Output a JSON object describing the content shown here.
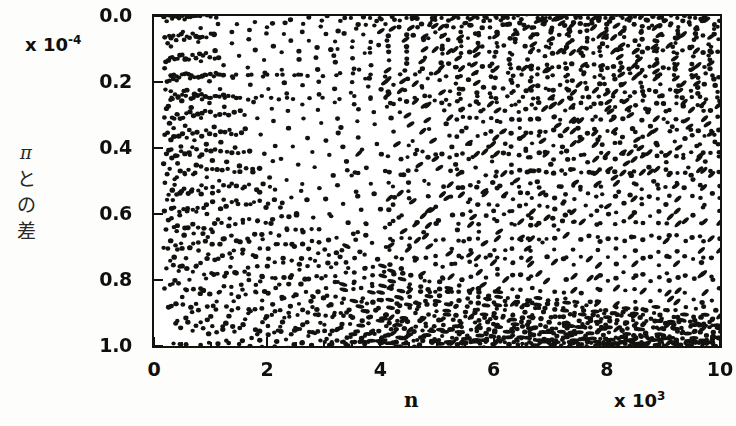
{
  "figure": {
    "background": "#fdfdfb",
    "ink_color": "#14120f"
  },
  "axes": {
    "y_multiplier": "x 10",
    "y_multiplier_exponent": "-4",
    "x_multiplier": "x 10",
    "x_multiplier_exponent": "3",
    "x_axis_title": "n",
    "y_axis_title_chars": [
      "π",
      "と",
      "の",
      "差"
    ],
    "y_tick_labels": [
      "1.0",
      "0.8",
      "0.6",
      "0.4",
      "0.2",
      "0.0"
    ],
    "x_tick_labels": [
      "0",
      "2",
      "4",
      "6",
      "8",
      "10"
    ]
  },
  "chart_data": {
    "type": "scatter",
    "title": "",
    "subtitle": "",
    "xlabel": "n",
    "ylabel": "πとの差",
    "x_unit_multiplier": 1000,
    "y_unit_multiplier": 0.0001,
    "xlim": [
      0,
      10
    ],
    "ylim": [
      0.0,
      1.0
    ],
    "xticks": [
      0,
      2,
      4,
      6,
      8,
      10
    ],
    "yticks": [
      0.0,
      0.2,
      0.4,
      0.6,
      0.8,
      1.0
    ],
    "x_minor_tick_step": 0.5,
    "grid": false,
    "legend": null,
    "marker": {
      "shape": "circle",
      "color": "#14120f",
      "size_px": 4.6
    },
    "generator": {
      "family": "fractional-part-hyperbolae",
      "note": "Points lie at y = frac(n*alpha)/n style loci; each arc k is y_k(x) = c_k / x with c_k spanning the listed constants, plus horizontal loci listed in horizontal_bands.",
      "alpha": 3.14159265358979,
      "n_min": 120,
      "n_max": 10000,
      "n_step": 1
    },
    "horizontal_bands": [
      {
        "y": 0.822,
        "x_from": 0.3,
        "x_to": 10.0,
        "spacing": 0.27
      },
      {
        "y": 0.752,
        "x_from": 0.3,
        "x_to": 10.0,
        "spacing": 0.27
      }
    ],
    "arc_constants": [
      0.3,
      0.52,
      0.74,
      0.98,
      1.24,
      1.52,
      1.82,
      2.14,
      2.48,
      2.84,
      3.22,
      3.62,
      4.04,
      4.48,
      4.94,
      5.42,
      5.92,
      6.44,
      6.98,
      7.54,
      8.12,
      8.72,
      9.34,
      9.98
    ],
    "sample_points": [
      {
        "x": 0.35,
        "y": 0.822
      },
      {
        "x": 0.62,
        "y": 0.822
      },
      {
        "x": 0.9,
        "y": 0.822
      },
      {
        "x": 1.17,
        "y": 0.822
      },
      {
        "x": 1.45,
        "y": 0.822
      },
      {
        "x": 1.72,
        "y": 0.822
      },
      {
        "x": 2.0,
        "y": 0.822
      },
      {
        "x": 2.27,
        "y": 0.822
      },
      {
        "x": 2.55,
        "y": 0.822
      },
      {
        "x": 0.42,
        "y": 0.752
      },
      {
        "x": 0.7,
        "y": 0.752
      },
      {
        "x": 0.97,
        "y": 0.752
      },
      {
        "x": 1.25,
        "y": 0.752
      },
      {
        "x": 1.52,
        "y": 0.752
      },
      {
        "x": 1.8,
        "y": 0.752
      },
      {
        "x": 2.07,
        "y": 0.752
      },
      {
        "x": 2.35,
        "y": 0.752
      },
      {
        "x": 1.1,
        "y": 0.995
      },
      {
        "x": 1.6,
        "y": 0.7
      },
      {
        "x": 2.1,
        "y": 0.56
      },
      {
        "x": 2.6,
        "y": 0.47
      },
      {
        "x": 3.1,
        "y": 0.4
      },
      {
        "x": 3.6,
        "y": 0.345
      },
      {
        "x": 4.1,
        "y": 0.3
      },
      {
        "x": 4.6,
        "y": 0.268
      },
      {
        "x": 5.1,
        "y": 0.24
      },
      {
        "x": 0.95,
        "y": 0.33
      },
      {
        "x": 1.35,
        "y": 0.24
      },
      {
        "x": 1.8,
        "y": 0.185
      },
      {
        "x": 2.3,
        "y": 0.145
      },
      {
        "x": 2.8,
        "y": 0.118
      },
      {
        "x": 3.3,
        "y": 0.1
      },
      {
        "x": 3.8,
        "y": 0.086
      },
      {
        "x": 4.3,
        "y": 0.076
      },
      {
        "x": 4.8,
        "y": 0.068
      },
      {
        "x": 9.6,
        "y": 0.96
      },
      {
        "x": 9.8,
        "y": 0.88
      },
      {
        "x": 9.9,
        "y": 0.64
      },
      {
        "x": 9.7,
        "y": 0.42
      },
      {
        "x": 9.85,
        "y": 0.21
      },
      {
        "x": 9.95,
        "y": 0.06
      }
    ]
  }
}
